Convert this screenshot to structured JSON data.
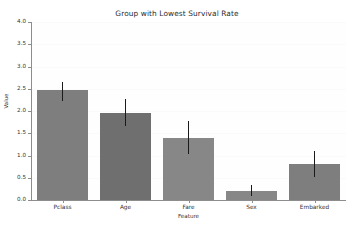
{
  "chart_data": {
    "type": "bar",
    "title": "Group with Lowest Survival Rate",
    "xlabel": "Feature",
    "ylabel": "Value",
    "categories": [
      "Pclass",
      "Age",
      "Fare",
      "Sex",
      "Embarked"
    ],
    "values": [
      2.47,
      1.96,
      1.39,
      0.21,
      0.81
    ],
    "errors_low": [
      2.22,
      1.67,
      1.04,
      0.1,
      0.52
    ],
    "errors_high": [
      2.65,
      2.26,
      1.77,
      0.33,
      1.11
    ],
    "ylim": [
      0.0,
      4.0
    ],
    "ytick_labels": [
      "0.0",
      "0.5",
      "1.0",
      "1.5",
      "2.0",
      "2.5",
      "3.0",
      "3.5",
      "4.0"
    ],
    "ytick_values": [
      0.0,
      0.5,
      1.0,
      1.5,
      2.0,
      2.5,
      3.0,
      3.5,
      4.0
    ],
    "grid": false,
    "legend": null,
    "bar_color": "#7f7f7f",
    "error_color": "#1a1a1a",
    "background_color": "#ffffff"
  }
}
